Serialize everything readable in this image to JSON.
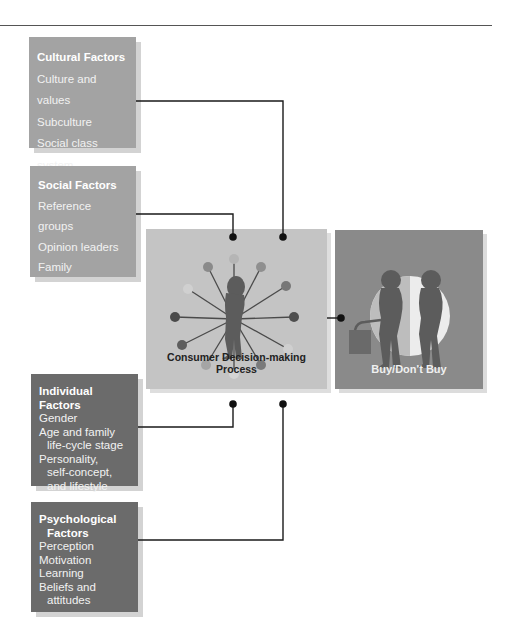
{
  "diagram": {
    "type": "flow",
    "factors": [
      {
        "title": "Cultural Factors",
        "items": [
          "Culture and values",
          "Subculture",
          "Social class system"
        ],
        "shade": "light"
      },
      {
        "title": "Social Factors",
        "items": [
          "Reference groups",
          "Opinion leaders",
          "Family"
        ],
        "shade": "light"
      },
      {
        "title": "Individual Factors",
        "items": [
          "Gender",
          "Age and family",
          "life-cycle stage",
          "Personality,",
          "self-concept,",
          "and lifestyle"
        ],
        "shade": "dark"
      },
      {
        "title_lines": [
          "Psychological",
          "Factors"
        ],
        "items": [
          "Perception",
          "Motivation",
          "Learning",
          "Beliefs and",
          "attitudes"
        ],
        "shade": "dark"
      }
    ],
    "process": {
      "label": "Consumer Decision-making Process"
    },
    "outcome": {
      "label": "Buy/Don't Buy"
    },
    "colors": {
      "light_box": "#a3a3a3",
      "dark_box": "#6b6b6b",
      "process_box": "#c4c4c4",
      "outcome_box": "#8a8a8a",
      "connector": "#1a1a1a"
    }
  }
}
